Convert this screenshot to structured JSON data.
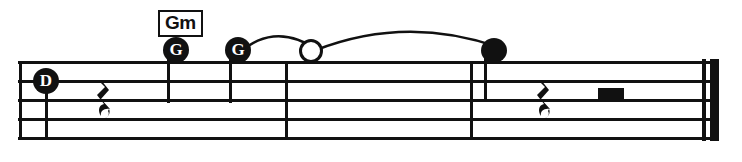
{
  "staff": {
    "line_count": 5,
    "left_edge_x": 18,
    "right_edge_x": 716,
    "line_ys": [
      61,
      80,
      99,
      118,
      137
    ],
    "line_thickness": 3
  },
  "barlines": [
    {
      "name": "opening-barline",
      "x": 20,
      "type": "single"
    },
    {
      "name": "measure-barline-1",
      "x": 285,
      "type": "single"
    },
    {
      "name": "measure-barline-2",
      "x": 470,
      "type": "single"
    },
    {
      "name": "final-barline",
      "x": 705,
      "type": "double-thin-thick"
    }
  ],
  "chord_symbols": [
    {
      "name": "chord-gm",
      "label": "Gm",
      "x": 158,
      "y": 10
    }
  ],
  "notes": [
    {
      "name": "note-d",
      "label": "D",
      "head": "lettered-filled",
      "x": 41,
      "y": 68,
      "stem": "down",
      "stem_x": 45,
      "stem_top": 80,
      "stem_bottom": 140
    },
    {
      "name": "note-g-1",
      "label": "G",
      "head": "lettered-filled",
      "x": 163,
      "y": 37,
      "stem": "down",
      "stem_x": 167,
      "stem_top": 50,
      "stem_bottom": 103
    },
    {
      "name": "note-g-2",
      "label": "G",
      "head": "lettered-filled",
      "x": 225,
      "y": 37,
      "stem": "down",
      "stem_x": 229,
      "stem_top": 50,
      "stem_bottom": 103
    },
    {
      "name": "note-open-whole",
      "label": "",
      "head": "open",
      "x": 299,
      "y": 39,
      "stem": "none"
    },
    {
      "name": "note-filled-black",
      "label": "",
      "head": "filled",
      "x": 481,
      "y": 38,
      "stem": "down",
      "stem_x": 484,
      "stem_top": 50,
      "stem_bottom": 102
    }
  ],
  "ties": [
    {
      "name": "tie-g-to-open",
      "from": "note-g-2",
      "to": "note-open-whole",
      "x1": 238,
      "x2": 312,
      "peak_y": 26
    },
    {
      "name": "tie-open-to-filled",
      "from": "note-open-whole",
      "to": "note-filled-black",
      "x1": 318,
      "x2": 492,
      "peak_y": 23
    }
  ],
  "rests": [
    {
      "name": "rest-quarter-1",
      "type": "quarter",
      "x": 95,
      "y": 80
    },
    {
      "name": "rest-quarter-2",
      "type": "quarter",
      "x": 535,
      "y": 80
    },
    {
      "name": "rest-half-1",
      "type": "half",
      "x": 598,
      "y": 88
    }
  ],
  "colors": {
    "ink": "#111111",
    "paper": "#ffffff"
  }
}
